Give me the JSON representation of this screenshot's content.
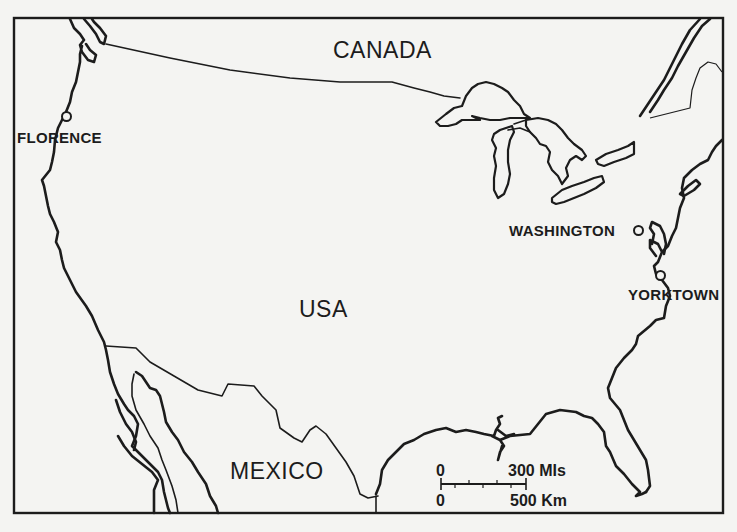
{
  "map": {
    "countries": {
      "canada": "CANADA",
      "usa": "USA",
      "mexico": "MEXICO"
    },
    "cities": {
      "florence": "FLORENCE",
      "washington": "WASHINGTON",
      "yorktown": "YORKTOWN"
    },
    "scale": {
      "top_zero": "0",
      "top_label": "300 MIs",
      "bottom_zero": "0",
      "bottom_label": "500 Km"
    },
    "colors": {
      "ink": "#1c1c1c",
      "paper": "#f4f4f2"
    }
  }
}
